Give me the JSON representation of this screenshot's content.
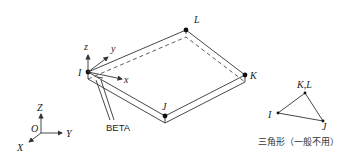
{
  "diagram": {
    "shell": {
      "nodes": {
        "I": {
          "label": "I",
          "x": 88,
          "y": 72
        },
        "J": {
          "label": "J",
          "x": 165,
          "y": 116
        },
        "K": {
          "label": "K",
          "x": 245,
          "y": 75
        },
        "L": {
          "label": "L",
          "x": 186,
          "y": 30
        }
      },
      "local_axes": {
        "x": "x",
        "y": "y",
        "z": "z"
      },
      "beta_label": "BETA"
    },
    "global_axes": {
      "origin": "O",
      "x": "X",
      "y": "Y",
      "z": "Z"
    },
    "triangle": {
      "nodes": {
        "KL": "K,L",
        "I": "I",
        "J": "J"
      },
      "caption": "三角形（一般不用）"
    }
  }
}
